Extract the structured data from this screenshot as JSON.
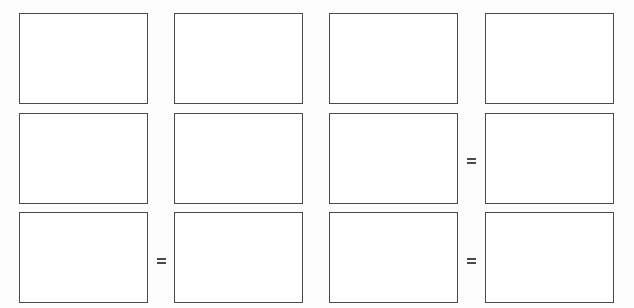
{
  "diagram": {
    "rows": [
      {
        "boxes": [
          {
            "content": ""
          },
          {
            "content": ""
          },
          {
            "content": ""
          },
          {
            "content": ""
          }
        ],
        "operators": [
          "",
          "",
          ""
        ]
      },
      {
        "boxes": [
          {
            "content": ""
          },
          {
            "content": ""
          },
          {
            "content": ""
          },
          {
            "content": ""
          }
        ],
        "operators": [
          "",
          "",
          "="
        ]
      },
      {
        "boxes": [
          {
            "content": ""
          },
          {
            "content": ""
          },
          {
            "content": ""
          },
          {
            "content": ""
          }
        ],
        "operators": [
          "=",
          "",
          "="
        ]
      }
    ],
    "operator_symbol": "="
  }
}
